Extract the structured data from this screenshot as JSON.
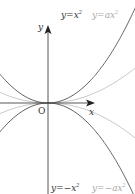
{
  "diagram": {
    "axes": {
      "x_label": "x",
      "y_label": "y",
      "origin_label": "O"
    },
    "curves": [
      {
        "name": "y-equals-x-squared",
        "label": "y=x²",
        "color": "#444444",
        "k": 0.0125
      },
      {
        "name": "y-equals-a-x-squared",
        "label": "y=ax²",
        "color": "#bbbbbb",
        "k": 0.0046
      },
      {
        "name": "y-equals-neg-x-squared",
        "label": "y=−x²",
        "color": "#444444",
        "k": -0.0125
      },
      {
        "name": "y-equals-neg-a-x-squared",
        "label": "y=−ax²",
        "color": "#bbbbbb",
        "k": -0.0046
      }
    ],
    "labels": {
      "top_dark": "y=x",
      "top_dark_exp": "2",
      "top_light": "y=ax",
      "top_light_exp": "2",
      "bottom_dark": "y=−x",
      "bottom_dark_exp": "2",
      "bottom_light": "y=−ax",
      "bottom_light_exp": "2"
    }
  }
}
